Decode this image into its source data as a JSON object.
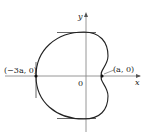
{
  "diagram": {
    "type": "cardioid-plot",
    "axes": {
      "x_label": "x",
      "y_label": "y",
      "origin_label": "0"
    },
    "points": [
      {
        "label": "(−3a, 0)",
        "name": "left-intercept"
      },
      {
        "label": "(a, 0)",
        "name": "cusp-point"
      }
    ],
    "tangent_lines": [
      "top-horizontal",
      "bottom-horizontal",
      "left-vertical"
    ],
    "colors": {
      "curve": "#222222",
      "axes": "#999999",
      "tangents": "#555555",
      "text": "#222222"
    }
  }
}
